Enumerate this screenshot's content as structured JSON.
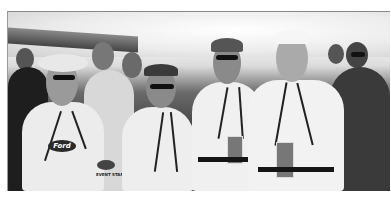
{
  "image": {
    "type": "black-and-white photograph",
    "description": "Group of event staff members in white polo shirts with lanyards and credential badges standing in a crowd at an outdoor event",
    "visible_text": {
      "sleeve_patch": "EVENT STAFF",
      "shirt_logo": "Ford"
    },
    "colors": {
      "background": "#ffffff",
      "shirts": "#eeeeee",
      "dark": "#1a1a1a",
      "sky": "#f0f0f0"
    }
  }
}
